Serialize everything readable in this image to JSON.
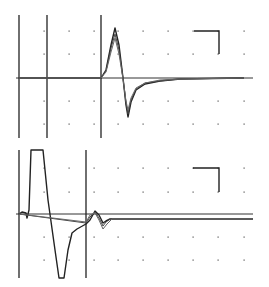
{
  "chart_data": [
    {
      "type": "line",
      "title": "",
      "panel": "top",
      "xlabel": "",
      "ylabel": "",
      "grid": "dotted",
      "legend": null,
      "description": "Overlaid oscilloscope traces: flat baseline, stimulus markers, then a biphasic response (positive peak followed by negative trough and slow recovery).",
      "markers_x_px": [
        19,
        47,
        101
      ],
      "baseline_y_px": 78,
      "scale_bar": {
        "x1": 194,
        "x2": 219,
        "y_top": 31,
        "y_bottom": 54
      },
      "series": [
        {
          "name": "trace-1",
          "points": [
            [
              19,
              78
            ],
            [
              101,
              78
            ],
            [
              106,
              70
            ],
            [
              111,
              45
            ],
            [
              115,
              28
            ],
            [
              119,
              45
            ],
            [
              123,
              78
            ],
            [
              126,
              105
            ],
            [
              128,
              117
            ],
            [
              131,
              102
            ],
            [
              136,
              90
            ],
            [
              145,
              84
            ],
            [
              160,
              81
            ],
            [
              180,
              79
            ],
            [
              244,
              78
            ]
          ]
        },
        {
          "name": "trace-2",
          "points": [
            [
              19,
              78
            ],
            [
              101,
              78
            ],
            [
              106,
              71
            ],
            [
              111,
              48
            ],
            [
              115,
              34
            ],
            [
              119,
              50
            ],
            [
              123,
              78
            ],
            [
              126,
              103
            ],
            [
              128,
              114
            ],
            [
              131,
              100
            ],
            [
              136,
              89
            ],
            [
              145,
              83
            ],
            [
              160,
              81
            ],
            [
              180,
              79
            ],
            [
              244,
              78
            ]
          ]
        },
        {
          "name": "trace-3",
          "points": [
            [
              19,
              78
            ],
            [
              101,
              78
            ],
            [
              106,
              72
            ],
            [
              111,
              52
            ],
            [
              115,
              38
            ],
            [
              119,
              54
            ],
            [
              123,
              79
            ],
            [
              126,
              101
            ],
            [
              128,
              110
            ],
            [
              131,
              98
            ],
            [
              136,
              88
            ],
            [
              145,
              83
            ],
            [
              160,
              80
            ],
            [
              180,
              79
            ],
            [
              244,
              78
            ]
          ]
        }
      ]
    },
    {
      "type": "line",
      "title": "",
      "panel": "bottom",
      "xlabel": "",
      "ylabel": "",
      "grid": "dotted",
      "legend": null,
      "description": "Overlaid traces with a large stimulus artifact followed by a small biphasic deflection and a sustained offset below baseline.",
      "markers_x_px": [
        19,
        86
      ],
      "baseline_y_px": 214,
      "scale_bar": {
        "x1": 193,
        "x2": 219,
        "y_top": 168,
        "y_bottom": 192
      },
      "series": [
        {
          "name": "trace-1",
          "points": [
            [
              19,
              214
            ],
            [
              22,
              212
            ],
            [
              26,
              213
            ],
            [
              27,
              218
            ],
            [
              29,
              210
            ],
            [
              31,
              150
            ],
            [
              43,
              150
            ],
            [
              48,
              200
            ],
            [
              55,
              250
            ],
            [
              59,
              278
            ],
            [
              64,
              278
            ],
            [
              68,
              250
            ],
            [
              72,
              233
            ],
            [
              77,
              229
            ],
            [
              86,
              224
            ],
            [
              90,
              220
            ],
            [
              95,
              211
            ],
            [
              99,
              215
            ],
            [
              103,
              223
            ],
            [
              106,
              221
            ],
            [
              110,
              219
            ],
            [
              130,
              219
            ],
            [
              253,
              219
            ]
          ]
        },
        {
          "name": "trace-2",
          "points": [
            [
              19,
              214
            ],
            [
              86,
              223
            ],
            [
              90,
              217
            ],
            [
              95,
              212
            ],
            [
              99,
              218
            ],
            [
              103,
              226
            ],
            [
              106,
              222
            ],
            [
              110,
              219
            ],
            [
              253,
              219
            ]
          ]
        },
        {
          "name": "trace-3",
          "points": [
            [
              19,
              214
            ],
            [
              86,
              222
            ],
            [
              90,
              215
            ],
            [
              95,
              213
            ],
            [
              99,
              220
            ],
            [
              103,
              229
            ],
            [
              107,
              224
            ],
            [
              112,
              219
            ],
            [
              253,
              219
            ]
          ]
        }
      ]
    }
  ]
}
